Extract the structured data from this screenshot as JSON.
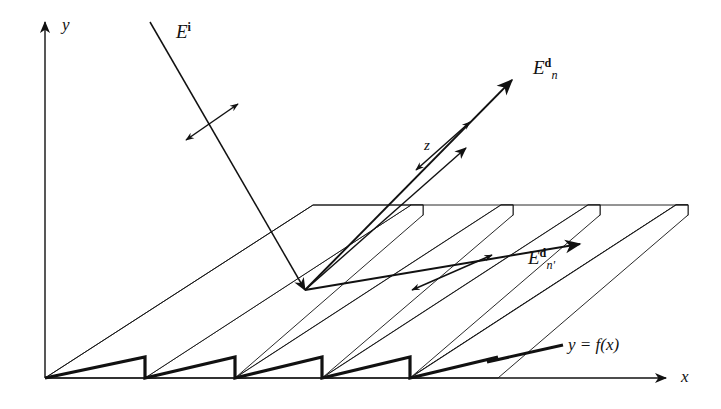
{
  "figure": {
    "kind": "schematic-diagram",
    "background_color": "#ffffff",
    "ink_color": "#111111",
    "facet_fill_color": "#d9d9d9",
    "width": 721,
    "height": 409
  },
  "axes": {
    "y": {
      "label": "y",
      "x": 62,
      "y": 16,
      "description": "vertical axis arrow pointing up"
    },
    "x": {
      "label": "x",
      "x": 681,
      "y": 368,
      "description": "horizontal axis arrow pointing right"
    },
    "z": {
      "label": "z",
      "x": 424,
      "y": 138,
      "description": "oblique depth axis arrow pointing up-right"
    }
  },
  "labels": {
    "incident": {
      "base": "E",
      "sup": "i",
      "sub": "",
      "x": 176,
      "y": 22,
      "meaning": "incident electric field"
    },
    "diffracted_n": {
      "base": "E",
      "sup": "d",
      "sub": "n",
      "x": 533,
      "y": 58,
      "meaning": "diffracted field of order n"
    },
    "diffracted_nprime": {
      "base": "E",
      "sup": "d",
      "sub": "n'",
      "x": 528,
      "y": 248,
      "meaning": "diffracted field of order n-prime"
    },
    "profile": {
      "text": "y = f(x)",
      "x": 568,
      "y": 336,
      "meaning": "grating surface profile function"
    }
  },
  "rays": [
    {
      "name": "incident-ray",
      "from": [
        150,
        22
      ],
      "to": [
        305,
        290
      ],
      "arrowhead": "end",
      "polarization_marker": true
    },
    {
      "name": "diffracted-ray-n",
      "from": [
        305,
        290
      ],
      "to": [
        512,
        80
      ],
      "arrowhead": "end",
      "polarization_marker": true
    },
    {
      "name": "diffracted-ray-nprime",
      "from": [
        305,
        290
      ],
      "to": [
        580,
        244
      ],
      "arrowhead": "end",
      "polarization_marker": true
    }
  ],
  "grating": {
    "groove_count": 4,
    "profile_type": "sawtooth-blazed",
    "origin": [
      45,
      378
    ],
    "teeth_riser_x": [
      145,
      235,
      322,
      410
    ],
    "facet_shading": "stippled halftone"
  }
}
